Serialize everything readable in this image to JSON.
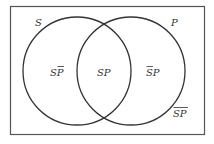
{
  "diagram": {
    "type": "venn",
    "sets": [
      {
        "name": "S",
        "label": "S"
      },
      {
        "name": "P",
        "label": "P"
      }
    ],
    "regions": [
      {
        "id": "s-not-p",
        "base": "SP",
        "overline": [
          "P"
        ],
        "text": "SP̄"
      },
      {
        "id": "s-and-p",
        "base": "SP",
        "overline": [],
        "text": "SP"
      },
      {
        "id": "not-s-p",
        "base": "SP",
        "overline": [
          "S"
        ],
        "text": "S̄P"
      },
      {
        "id": "not-s-not-p",
        "base": "SP",
        "overline": [
          "S",
          "P"
        ],
        "text": "S̄P̄"
      }
    ],
    "colors": {
      "stroke": "#333333",
      "background": "#ffffff"
    }
  },
  "labels": {
    "set_s": "S",
    "set_p": "P",
    "region_sp_s": "S",
    "region_sp_p": "P",
    "region_s_notp_s": "S",
    "region_s_notp_p": "P",
    "region_nots_p_s": "S",
    "region_nots_p_p": "P",
    "region_nots_notp": "SP"
  }
}
